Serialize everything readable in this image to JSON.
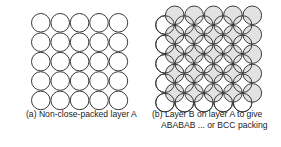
{
  "panel_a": {
    "caption": "(a)  Non-close-packed layer A",
    "layer": "A",
    "grid": {
      "rows": 5,
      "cols": 5
    }
  },
  "panel_b": {
    "caption_line1": "(b)  Layer B on layer A  to give",
    "caption_line2": "ABABAB ...  or BCC packing",
    "layer_a_grid": {
      "rows": 5,
      "cols": 5
    },
    "layer_b_grid": {
      "rows": 5,
      "cols": 5
    }
  },
  "colors": {
    "outline": "#3a3a3a",
    "layer_a_fill": "#ffffff",
    "layer_b_fill": "#e2e2e2"
  }
}
